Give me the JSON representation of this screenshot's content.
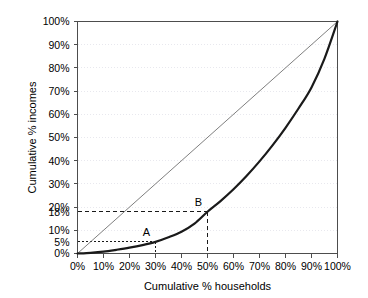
{
  "chart_data": {
    "type": "line",
    "title": "",
    "xlabel": "Cumulative % households",
    "ylabel": "Cumulative % incomes",
    "xlim": [
      0,
      100
    ],
    "ylim": [
      0,
      100
    ],
    "grid": true,
    "legend_position": "none",
    "x_tick_labels": [
      "0%",
      "10%",
      "20%",
      "30%",
      "40%",
      "50%",
      "60%",
      "70%",
      "80%",
      "90%",
      "100%"
    ],
    "x_tick_values": [
      0,
      10,
      20,
      30,
      40,
      50,
      60,
      70,
      80,
      90,
      100
    ],
    "y_tick_labels": [
      "0%",
      "10%",
      "20%",
      "30%",
      "40%",
      "50%",
      "60%",
      "70%",
      "80%",
      "90%",
      "100%"
    ],
    "y_tick_values": [
      0,
      10,
      20,
      30,
      40,
      50,
      60,
      70,
      80,
      90,
      100
    ],
    "extra_y_labels": [
      {
        "label": "5%",
        "value": 5
      },
      {
        "label": "18%",
        "value": 18
      }
    ],
    "series": [
      {
        "name": "Lorenz curve",
        "color": "#1a1a1a",
        "width": 2.2,
        "x": [
          0,
          5,
          10,
          15,
          20,
          25,
          30,
          35,
          40,
          45,
          50,
          55,
          60,
          65,
          70,
          75,
          80,
          85,
          90,
          95,
          100
        ],
        "values": [
          0,
          0.3,
          0.8,
          1.6,
          2.5,
          3.6,
          5.0,
          7.0,
          9.4,
          12.9,
          18.0,
          22.6,
          27.7,
          33.4,
          39.7,
          46.6,
          54.2,
          62.5,
          71.6,
          84.0,
          100.0
        ]
      },
      {
        "name": "Line of equality",
        "color": "#707070",
        "width": 0.9,
        "x": [
          0,
          100
        ],
        "values": [
          0,
          100
        ]
      }
    ],
    "annotations": [
      {
        "label": "A",
        "x": 30,
        "y": 5,
        "label_dx": -9,
        "label_dy": -6,
        "guide_style": "dotted"
      },
      {
        "label": "B",
        "x": 50,
        "y": 18,
        "label_dx": -9,
        "label_dy": -6,
        "guide_style": "dashed"
      }
    ]
  },
  "colors": {
    "axis": "#4d4d4d",
    "gridline": "#e8e8ee",
    "guide": "#1a1a1a",
    "curve": "#1a1a1a",
    "equality": "#707070",
    "background": "#ffffff"
  }
}
